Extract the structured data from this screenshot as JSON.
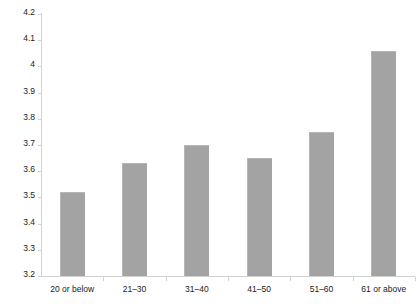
{
  "chart_data": {
    "type": "bar",
    "title": "",
    "subtitle": "",
    "xlabel": "",
    "ylabel": "",
    "categories": [
      "20 or below",
      "21–30",
      "31–40",
      "41–50",
      "51–60",
      "61 or above"
    ],
    "values": [
      3.52,
      3.63,
      3.7,
      3.65,
      3.75,
      4.06
    ],
    "ylim": [
      3.2,
      4.2
    ],
    "ytick_step": 0.1,
    "ytick_labels": [
      "4.2",
      "4.1",
      "4",
      "3.9",
      "3.8",
      "3.7",
      "3.6",
      "3.5",
      "3.4",
      "3.3",
      "3.2"
    ],
    "ytick_values": [
      4.2,
      4.1,
      4.0,
      3.9,
      3.8,
      3.7,
      3.6,
      3.5,
      3.4,
      3.3,
      3.2
    ],
    "grid": false,
    "legend": null,
    "legend_position": "none",
    "series": [
      {
        "name": "",
        "values": [
          3.52,
          3.63,
          3.7,
          3.65,
          3.75,
          4.06
        ]
      }
    ],
    "colors": {
      "bar_fill": "#a3a3a3",
      "bar_edge": "#b6b6b6",
      "axis_line": "#d2d2d2",
      "text": "#1a1a1a",
      "background": "#ffffff"
    }
  }
}
